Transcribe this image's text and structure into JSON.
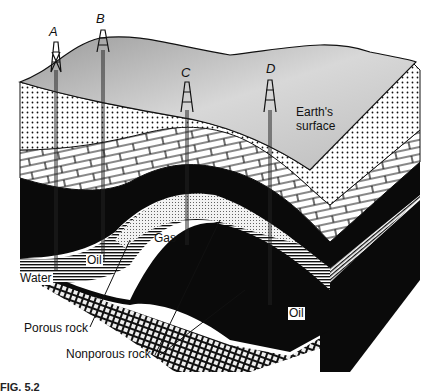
{
  "figure": {
    "caption": "FIG. 5.2",
    "wells": [
      {
        "id": "A",
        "label": "A"
      },
      {
        "id": "B",
        "label": "B"
      },
      {
        "id": "C",
        "label": "C"
      },
      {
        "id": "D",
        "label": "D"
      }
    ],
    "labels": {
      "earth_surface_line1": "Earth's",
      "earth_surface_line2": "surface",
      "gas": "Gas",
      "oil_left": "Oil",
      "oil_right": "Oil",
      "water": "Water",
      "porous_rock": "Porous rock",
      "nonporous_rock": "Nonporous rock"
    },
    "colors": {
      "surface_gray": "#bdbdbd",
      "black_layer": "#0a0a0a",
      "white": "#ffffff"
    }
  }
}
